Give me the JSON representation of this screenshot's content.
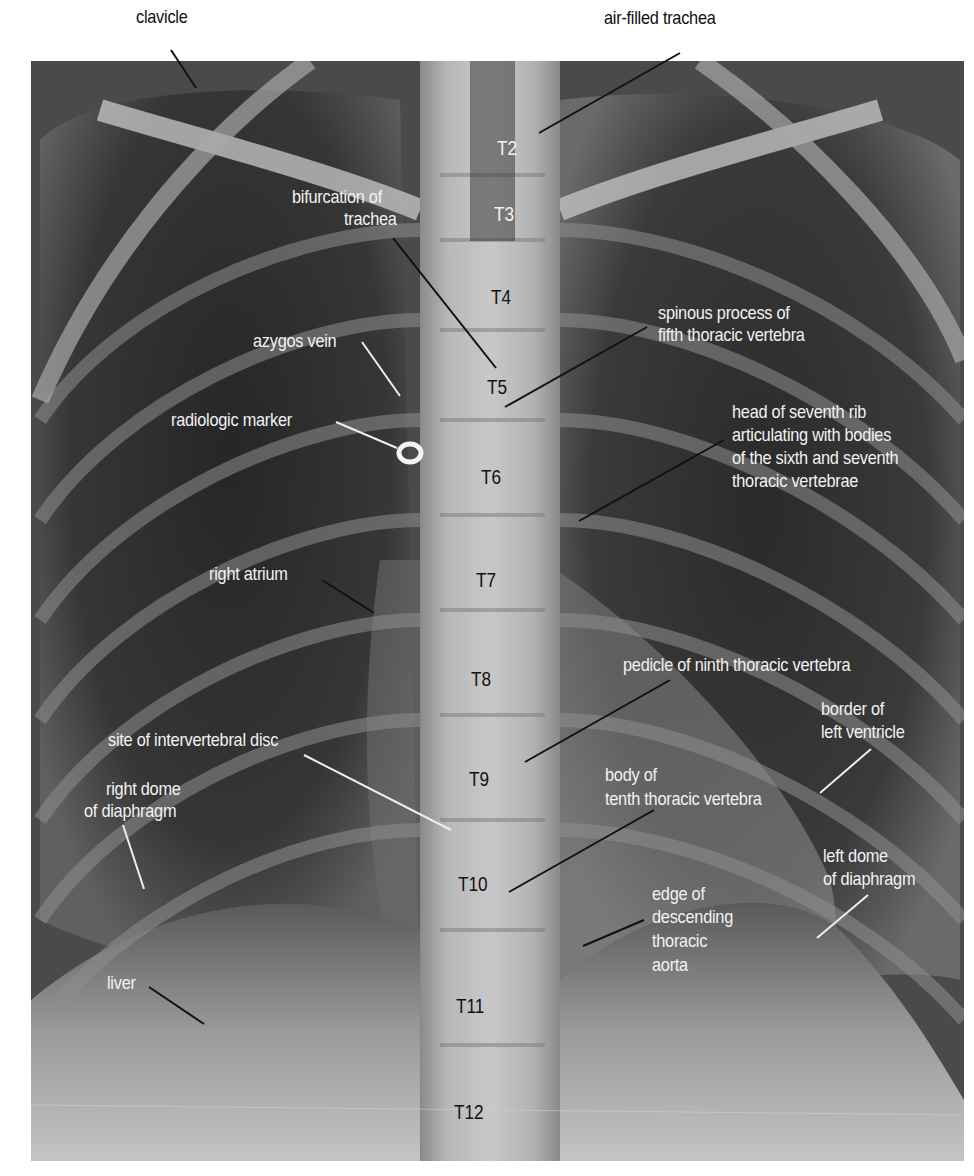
{
  "figure": {
    "type": "annotated chest radiograph (PA view)",
    "colors": {
      "background": "#ffffff",
      "label_on_dark": "#f2f2f2",
      "label_outside": "#111111",
      "leader_line": "#111111"
    }
  },
  "outside_labels": {
    "clavicle": "clavicle",
    "air_filled_trachea": "air-filled trachea"
  },
  "labels": {
    "bifurcation_line1": "bifurcation of",
    "bifurcation_line2": "trachea",
    "azygos_vein": "azygos vein",
    "radiologic_marker": "radiologic marker",
    "right_atrium": "right atrium",
    "site_of_disc": "site of intervertebral disc",
    "right_dome_line1": "right dome",
    "right_dome_line2": "of diaphragm",
    "liver": "liver",
    "spinous_line1": "spinous process of",
    "spinous_line2": "fifth thoracic vertebra",
    "head_rib_line1": "head of seventh rib",
    "head_rib_line2": "articulating with bodies",
    "head_rib_line3": "of the sixth and seventh",
    "head_rib_line4": "thoracic vertebrae",
    "pedicle": "pedicle of ninth thoracic vertebra",
    "border_lv_line1": "border of",
    "border_lv_line2": "left ventricle",
    "body_t10_line1": "body of",
    "body_t10_line2": "tenth thoracic vertebra",
    "left_dome_line1": "left dome",
    "left_dome_line2": "of diaphragm",
    "aorta_line1": "edge of",
    "aorta_line2": "descending",
    "aorta_line3": "thoracic",
    "aorta_line4": "aorta"
  },
  "vertebrae": [
    "T2",
    "T3",
    "T4",
    "T5",
    "T6",
    "T7",
    "T8",
    "T9",
    "T10",
    "T11",
    "T12"
  ]
}
